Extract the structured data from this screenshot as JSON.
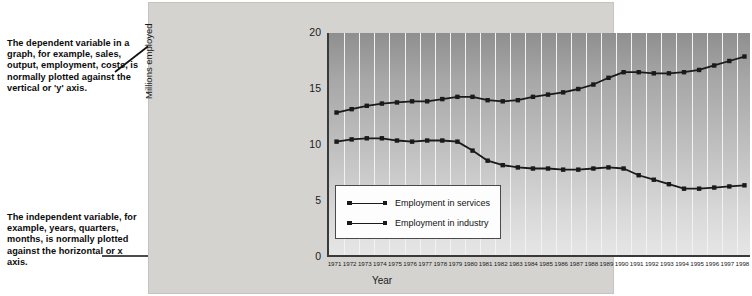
{
  "annotations": {
    "dependent": "The dependent variable in a graph, for example, sales, output, employment, costs, is normally plotted against the vertical or 'y' axis.",
    "independent": "The independent variable, for example, years, quarters, months, is normally plotted against the horizontal or x axis."
  },
  "legend": {
    "services_label": "Employment in services",
    "industry_label": "Employment in industry"
  },
  "axes": {
    "ylabel": "Millions employed",
    "xlabel": "Year",
    "yticks": [
      "0",
      "5",
      "10",
      "15",
      "20"
    ]
  },
  "colors": {
    "line": "#1a1a1a",
    "axis": "#3a3a3a",
    "panel": "#d4d3d0",
    "gridline": "#f2f2f2",
    "legend_bg": "#fdfdfd",
    "text": "#0b0b0b"
  },
  "chart_data": {
    "type": "line",
    "title": "",
    "xlabel": "Year",
    "ylabel": "Millions employed",
    "xlim": [
      1971,
      1998
    ],
    "ylim": [
      0,
      20
    ],
    "yticks": [
      0,
      5,
      10,
      15,
      20
    ],
    "grid": "vertical",
    "legend_position": "inside-lower-left",
    "categories": [
      "1971",
      "1972",
      "1973",
      "1974",
      "1975",
      "1976",
      "1977",
      "1978",
      "1979",
      "1980",
      "1981",
      "1982",
      "1983",
      "1984",
      "1985",
      "1986",
      "1987",
      "1988",
      "1989",
      "1990",
      "1991",
      "1992",
      "1993",
      "1994",
      "1995",
      "1996",
      "1997",
      "1998"
    ],
    "series": [
      {
        "name": "Employment in services",
        "values": [
          12.9,
          13.2,
          13.5,
          13.7,
          13.8,
          13.9,
          13.9,
          14.1,
          14.3,
          14.3,
          14.0,
          13.9,
          14.0,
          14.3,
          14.5,
          14.7,
          15.0,
          15.4,
          16.0,
          16.5,
          16.5,
          16.4,
          16.4,
          16.5,
          16.7,
          17.1,
          17.5,
          17.9
        ]
      },
      {
        "name": "Employment in industry",
        "values": [
          10.3,
          10.5,
          10.6,
          10.6,
          10.4,
          10.3,
          10.4,
          10.4,
          10.3,
          9.5,
          8.6,
          8.2,
          8.0,
          7.9,
          7.9,
          7.8,
          7.8,
          7.9,
          8.0,
          7.9,
          7.3,
          6.9,
          6.5,
          6.1,
          6.1,
          6.2,
          6.3,
          6.4
        ]
      }
    ]
  }
}
